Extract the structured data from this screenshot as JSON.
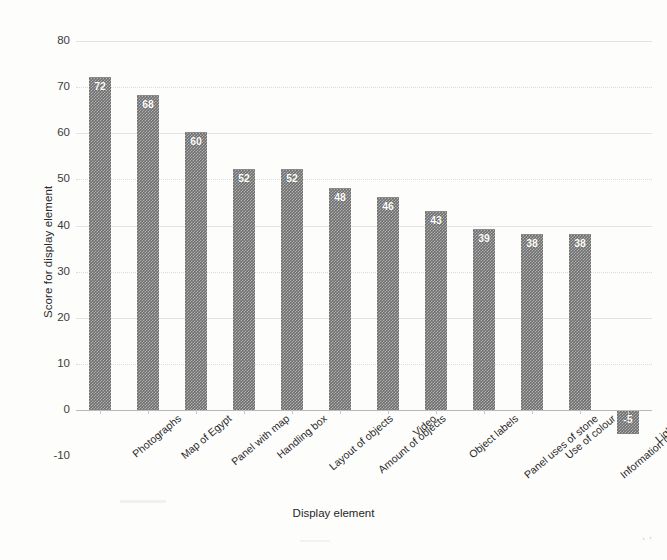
{
  "chart_data": {
    "type": "bar",
    "title": "",
    "xlabel": "Display element",
    "ylabel": "Score for display element",
    "ylim": [
      -10,
      80
    ],
    "ytick_step": 10,
    "yticks": [
      80,
      70,
      60,
      50,
      40,
      30,
      20,
      10,
      0,
      -10
    ],
    "grid": true,
    "grid_orientation": "horizontal",
    "legend": "none",
    "bar_color": "#6e6e6e",
    "bar_pattern": "checkerboard-dither",
    "value_label_color": "#ffffff",
    "value_labels_inside_bars": true,
    "categories": [
      "Photographs",
      "Map of Egypt",
      "Panel with map",
      "Handling box",
      "Layout of objects",
      "Amount of objects",
      "Video",
      "Object labels",
      "Panel uses of stone",
      "Use of colour",
      "Information on label",
      "Lighting"
    ],
    "values": [
      72,
      68,
      60,
      52,
      52,
      48,
      46,
      43,
      39,
      38,
      38,
      -5
    ]
  },
  "axes": {
    "y_title": "Score for display element",
    "x_title": "Display element"
  },
  "artifact": {
    "corner_mark": "' '"
  }
}
